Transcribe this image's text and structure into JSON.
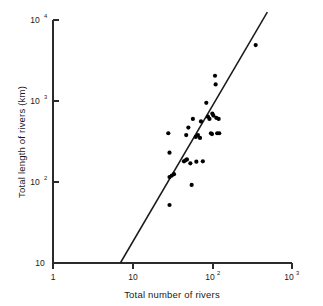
{
  "chart_data": {
    "type": "scatter",
    "title": "",
    "xlabel": "Total number of rivers",
    "ylabel": "Total length of rivers (km)",
    "xscale": "log",
    "yscale": "log",
    "xlim": [
      1,
      1000
    ],
    "ylim": [
      10,
      10000
    ],
    "grid": false,
    "legend": null,
    "xticks": [
      {
        "value": 1,
        "label": "1",
        "mantissa": "1",
        "exponent": ""
      },
      {
        "value": 10,
        "label": "10",
        "mantissa": "10",
        "exponent": ""
      },
      {
        "value": 100,
        "label": "10²",
        "mantissa": "10",
        "exponent": "2"
      },
      {
        "value": 1000,
        "label": "10³",
        "mantissa": "10",
        "exponent": "3"
      }
    ],
    "yticks": [
      {
        "value": 10,
        "label": "10",
        "mantissa": "10",
        "exponent": ""
      },
      {
        "value": 100,
        "label": "10²",
        "mantissa": "10",
        "exponent": "2"
      },
      {
        "value": 1000,
        "label": "10³",
        "mantissa": "10",
        "exponent": "3"
      },
      {
        "value": 10000,
        "label": "10⁴",
        "mantissa": "10",
        "exponent": "4"
      }
    ],
    "series": [
      {
        "name": "rivers",
        "marker": "filled-circle",
        "marker_color": "#000000",
        "marker_size": 4.2,
        "points": [
          {
            "x": 28,
            "y": 400
          },
          {
            "x": 29,
            "y": 230
          },
          {
            "x": 29,
            "y": 115
          },
          {
            "x": 31,
            "y": 120
          },
          {
            "x": 29,
            "y": 52
          },
          {
            "x": 33,
            "y": 125
          },
          {
            "x": 44,
            "y": 180
          },
          {
            "x": 46,
            "y": 185
          },
          {
            "x": 48,
            "y": 190
          },
          {
            "x": 47,
            "y": 380
          },
          {
            "x": 50,
            "y": 470
          },
          {
            "x": 53,
            "y": 170
          },
          {
            "x": 55,
            "y": 92
          },
          {
            "x": 57,
            "y": 600
          },
          {
            "x": 62,
            "y": 360
          },
          {
            "x": 63,
            "y": 178
          },
          {
            "x": 66,
            "y": 380
          },
          {
            "x": 70,
            "y": 350
          },
          {
            "x": 72,
            "y": 560
          },
          {
            "x": 76,
            "y": 180
          },
          {
            "x": 84,
            "y": 950
          },
          {
            "x": 88,
            "y": 640
          },
          {
            "x": 92,
            "y": 600
          },
          {
            "x": 96,
            "y": 400
          },
          {
            "x": 99,
            "y": 390
          },
          {
            "x": 100,
            "y": 700
          },
          {
            "x": 103,
            "y": 660
          },
          {
            "x": 108,
            "y": 2050
          },
          {
            "x": 110,
            "y": 1600
          },
          {
            "x": 112,
            "y": 620
          },
          {
            "x": 115,
            "y": 400
          },
          {
            "x": 120,
            "y": 600
          },
          {
            "x": 122,
            "y": 400
          },
          {
            "x": 350,
            "y": 4900
          }
        ]
      }
    ],
    "fit_line": {
      "name": "regression-line",
      "color": "#1a1a1a",
      "x_start": 7.0,
      "y_start": 10,
      "x_end": 490,
      "y_end": 12500
    }
  }
}
